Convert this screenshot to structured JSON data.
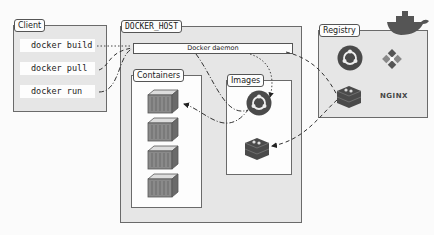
{
  "client": {
    "label": "Client",
    "commands": [
      "docker build",
      "docker pull",
      "docker run"
    ]
  },
  "host": {
    "label": "DOCKER_HOST",
    "daemon": "Docker daemon",
    "containers": {
      "label": "Containers",
      "count": 4
    },
    "images": {
      "label": "Images",
      "items": [
        "ubuntu-icon",
        "redis-icon"
      ]
    }
  },
  "registry": {
    "label": "Registry",
    "items": [
      "ubuntu-icon",
      "centos-icon",
      "redis-icon",
      "nginx-logo"
    ],
    "nginx_text": "NGINX"
  },
  "colors": {
    "box_fill": "#e6e6e6",
    "border": "#6a6a6a",
    "icon_dark": "#4a4a4a",
    "line": "#333333"
  }
}
